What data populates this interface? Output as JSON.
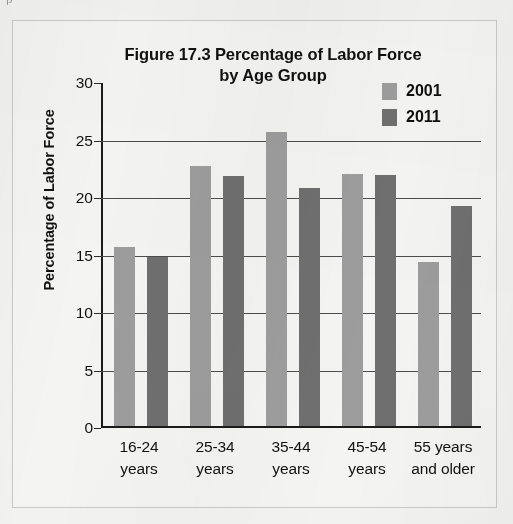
{
  "page": {
    "background_color": "#f2f2f1",
    "bleed_text": "p  ·  ·  ·"
  },
  "chart_data": {
    "type": "bar",
    "title": "Figure 17.3 Percentage of Labor Force by Age Group",
    "title_line1": "Figure 17.3 Percentage of Labor Force",
    "title_line2": "by Age Group",
    "xlabel": "",
    "ylabel": "Percentage of Labor Force",
    "ylim": [
      0,
      30
    ],
    "ytick_values": [
      30,
      25,
      20,
      15,
      10,
      5,
      0
    ],
    "ytick_labels": [
      "30",
      "25",
      "20",
      "15",
      "10",
      "5",
      "0"
    ],
    "grid": true,
    "legend_position": "top-right",
    "categories": [
      "16-24 years",
      "25-34 years",
      "35-44 years",
      "45-54 years",
      "55 years and older"
    ],
    "category_lines": [
      [
        "16-24",
        "years"
      ],
      [
        "25-34",
        "years"
      ],
      [
        "35-44",
        "years"
      ],
      [
        "45-54",
        "years"
      ],
      [
        "55 years",
        "and older"
      ]
    ],
    "series": [
      {
        "name": "2001",
        "color": "#9d9d9d",
        "values": [
          15.7,
          22.8,
          25.7,
          22.1,
          14.4
        ]
      },
      {
        "name": "2011",
        "color": "#6f6f6f",
        "values": [
          14.9,
          21.9,
          20.9,
          22.0,
          19.3
        ]
      }
    ]
  },
  "legend": {
    "items": [
      {
        "label": "2001",
        "color": "#9d9d9d"
      },
      {
        "label": "2011",
        "color": "#6f6f6f"
      }
    ]
  }
}
